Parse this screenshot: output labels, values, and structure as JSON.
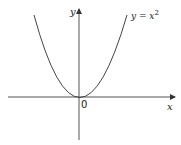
{
  "diagram": {
    "type": "function-graph",
    "curve_label": "y = x²",
    "curve_label_base": "y = x",
    "curve_label_exp": "2",
    "x_axis_label": "x",
    "y_axis_label": "y",
    "origin_label": "0",
    "line_color": "#555555"
  }
}
